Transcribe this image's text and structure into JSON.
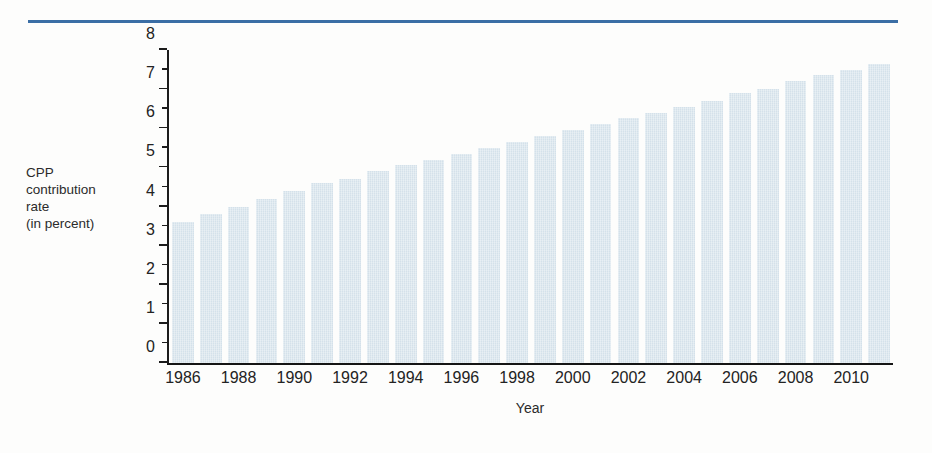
{
  "figure": {
    "rule_color": "#3b6ea5",
    "bar_color": "#d4e1ea",
    "axis_color": "#1c1c1c"
  },
  "axis": {
    "y_caption": "CPP\ncontribution\nrate\n(in percent)",
    "x_caption": "Year"
  },
  "chart_data": {
    "type": "bar",
    "title": "",
    "xlabel": "Year",
    "ylabel": "CPP contribution rate (in percent)",
    "ylim": [
      0,
      8
    ],
    "ytick_step": 1,
    "yminor_step": 0.5,
    "grid": false,
    "legend": null,
    "ytick_labels": [
      "0",
      "1",
      "2",
      "3",
      "4",
      "5",
      "6",
      "7",
      "8"
    ],
    "ytick_values": [
      0,
      1,
      2,
      3,
      4,
      5,
      6,
      7,
      8
    ],
    "xtick_labels": [
      "1986",
      "1988",
      "1990",
      "1992",
      "1994",
      "1996",
      "1998",
      "2000",
      "2002",
      "2004",
      "2006",
      "2008",
      "2010"
    ],
    "xtick_values": [
      1986,
      1988,
      1990,
      1992,
      1994,
      1996,
      1998,
      2000,
      2002,
      2004,
      2006,
      2008,
      2010
    ],
    "categories": [
      1986,
      1987,
      1988,
      1989,
      1990,
      1991,
      1992,
      1993,
      1994,
      1995,
      1996,
      1997,
      1998,
      1999,
      2000,
      2001,
      2002,
      2003,
      2004,
      2005,
      2006,
      2007,
      2008,
      2009,
      2010,
      2011
    ],
    "values": [
      3.6,
      3.8,
      4.0,
      4.2,
      4.4,
      4.6,
      4.7,
      4.9,
      5.05,
      5.2,
      5.35,
      5.5,
      5.65,
      5.8,
      5.95,
      6.1,
      6.25,
      6.4,
      6.55,
      6.7,
      6.9,
      7.0,
      7.2,
      7.35,
      7.5,
      7.65
    ]
  }
}
